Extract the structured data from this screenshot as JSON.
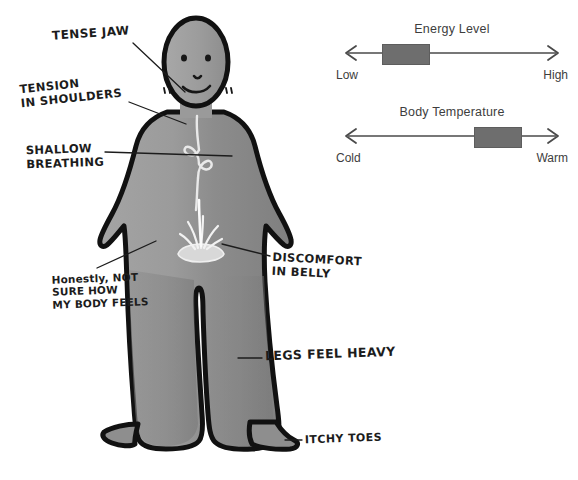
{
  "page": {
    "background_color": "#ffffff",
    "ink_color": "#1c1c1c"
  },
  "figure": {
    "name": "body-figure",
    "body_fill": "#8e8e8e",
    "body_fill_light": "#a9a9a9",
    "outline_color": "#111111",
    "belly_detail": "flame-in-bowl",
    "chest_detail": "wispy-breath-line"
  },
  "annotations": [
    {
      "id": "tense-jaw",
      "text": "TENSE JAW"
    },
    {
      "id": "tension",
      "text": "TENSION\nIN SHOULDERS"
    },
    {
      "id": "shallow",
      "text": "SHALLOW\nBREATHING"
    },
    {
      "id": "honestly",
      "text": "Honestly, NOT\nSURE HOW\nMY BODY FEELS"
    },
    {
      "id": "discomfort",
      "text": "DISCOMFORT\nIN BELLY"
    },
    {
      "id": "legs",
      "text": "LEGS FEEL HEAVY"
    },
    {
      "id": "itchy",
      "text": "ITCHY TOES"
    }
  ],
  "sliders": [
    {
      "id": "energy-level",
      "title": "Energy Level",
      "left_label": "Low",
      "right_label": "High",
      "value_percent": 21,
      "handle_color": "#6e6e6e",
      "track_color": "#4a4a4a"
    },
    {
      "id": "body-temperature",
      "title": "Body Temperature",
      "left_label": "Cold",
      "right_label": "Warm",
      "value_percent": 78,
      "handle_color": "#6e6e6e",
      "track_color": "#4a4a4a"
    }
  ]
}
